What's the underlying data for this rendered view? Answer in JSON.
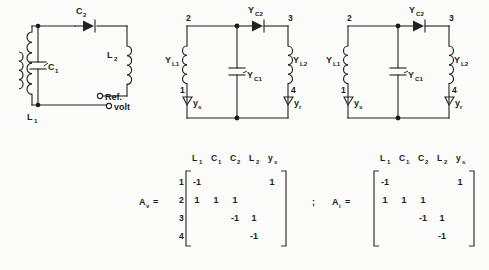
{
  "figure": {
    "background_color": "#fbfbfa",
    "ink_color": "#1d1d1d"
  },
  "circuits": [
    {
      "id": "circuit-1",
      "name": "tuned-amplifier-schematic",
      "components": [
        {
          "label": "C",
          "sub": "2",
          "type": "capacitor-diode-symbol"
        },
        {
          "label": "C",
          "sub": "1",
          "type": "capacitor"
        },
        {
          "label": "L",
          "sub": "2",
          "type": "inductor"
        },
        {
          "label": "L",
          "sub": "1",
          "type": "transformer-primary"
        }
      ],
      "terminals": [
        {
          "label": "Ref."
        },
        {
          "label": "volt"
        }
      ]
    },
    {
      "id": "circuit-2",
      "name": "admittance-network-middle",
      "components": [
        {
          "label": "Y",
          "sub": "C2",
          "type": "capacitor-diode-symbol"
        },
        {
          "label": "Y",
          "sub": "C1",
          "type": "capacitor"
        },
        {
          "label": "Y",
          "sub": "L1",
          "type": "inductor"
        },
        {
          "label": "Y",
          "sub": "L2",
          "type": "inductor"
        },
        {
          "label": "y",
          "sub": "s",
          "type": "source-admittance"
        },
        {
          "label": "y",
          "sub": "r",
          "type": "load-admittance"
        }
      ],
      "nodes": [
        "1",
        "2",
        "3",
        "4"
      ]
    },
    {
      "id": "circuit-3",
      "name": "admittance-network-right",
      "components": [
        {
          "label": "Y",
          "sub": "C2",
          "type": "capacitor-diode-symbol"
        },
        {
          "label": "Y",
          "sub": "C1",
          "type": "capacitor"
        },
        {
          "label": "Y",
          "sub": "L1",
          "type": "inductor"
        },
        {
          "label": "Y",
          "sub": "L2",
          "type": "inductor"
        },
        {
          "label": "y",
          "sub": "s",
          "type": "source-admittance"
        },
        {
          "label": "y",
          "sub": "r",
          "type": "load-admittance"
        }
      ],
      "nodes": [
        "1",
        "2",
        "3",
        "4"
      ]
    }
  ],
  "matrices": [
    {
      "id": "matrix-av",
      "name": "A_v",
      "name_base": "A",
      "name_sub": "v",
      "separator": "",
      "col_headers": [
        {
          "base": "L",
          "sub": "1"
        },
        {
          "base": "C",
          "sub": "1"
        },
        {
          "base": "C",
          "sub": "2"
        },
        {
          "base": "L",
          "sub": "2"
        },
        {
          "base": "y",
          "sub": "s"
        }
      ],
      "row_headers": [
        "1",
        "2",
        "3",
        "4"
      ],
      "cells": [
        [
          "-1",
          "",
          "",
          "",
          "1"
        ],
        [
          "1",
          "1",
          "1",
          "",
          ""
        ],
        [
          "",
          "",
          "-1",
          "1",
          ""
        ],
        [
          "",
          "",
          "",
          "-1",
          ""
        ]
      ]
    },
    {
      "id": "matrix-ai",
      "name": "A_i",
      "name_base": "A",
      "name_sub": "i",
      "separator": ";",
      "col_headers": [
        {
          "base": "L",
          "sub": "1"
        },
        {
          "base": "C",
          "sub": "1"
        },
        {
          "base": "C",
          "sub": "2"
        },
        {
          "base": "L",
          "sub": "2"
        },
        {
          "base": "y",
          "sub": "s"
        }
      ],
      "row_headers": [
        "",
        "",
        "",
        ""
      ],
      "cells": [
        [
          "-1",
          "",
          "",
          "",
          "1"
        ],
        [
          "1",
          "1",
          "1",
          "",
          ""
        ],
        [
          "",
          "",
          "-1",
          "1",
          ""
        ],
        [
          "",
          "",
          "",
          "-1",
          ""
        ]
      ]
    }
  ]
}
